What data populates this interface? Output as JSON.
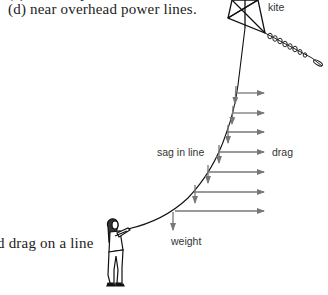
{
  "text": {
    "clipped_line": "(c) in stormy weather.",
    "item_d": "(d) near overhead power lines.",
    "caption_fragment": "d drag on a line"
  },
  "diagram": {
    "labels": {
      "kite": "kite",
      "sag": "sag in line",
      "drag": "drag",
      "weight": "weight"
    },
    "colors": {
      "line": "#111111",
      "arrow": "#777777",
      "text": "#222222"
    },
    "force_points": [
      {
        "x": 236,
        "y": 93
      },
      {
        "x": 232,
        "y": 113
      },
      {
        "x": 227,
        "y": 132
      },
      {
        "x": 218,
        "y": 152
      },
      {
        "x": 207,
        "y": 172
      },
      {
        "x": 194,
        "y": 192
      },
      {
        "x": 175,
        "y": 211
      }
    ],
    "drag_arrow_end_x": 266
  }
}
